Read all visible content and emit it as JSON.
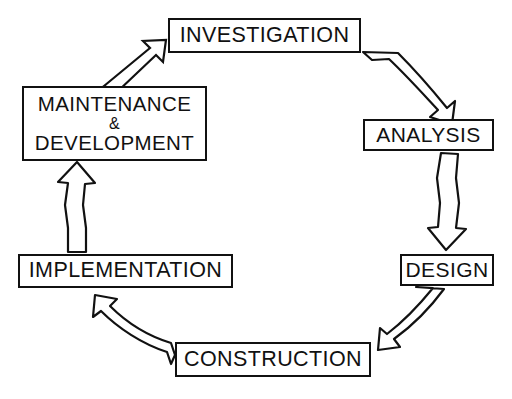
{
  "diagram": {
    "type": "cycle-diagram",
    "style": "hand-drawn black outline on white",
    "colors": {
      "stroke": "#111111",
      "background": "#ffffff",
      "text": "#111111"
    },
    "nodes": [
      {
        "id": "investigation",
        "label": "INVESTIGATION",
        "lines": [
          "INVESTIGATION"
        ],
        "position": "top-center"
      },
      {
        "id": "analysis",
        "label": "ANALYSIS",
        "lines": [
          "ANALYSIS"
        ],
        "position": "right-upper"
      },
      {
        "id": "design",
        "label": "DESIGN",
        "lines": [
          "DESIGN"
        ],
        "position": "right-lower"
      },
      {
        "id": "construction",
        "label": "CONSTRUCTION",
        "lines": [
          "CONSTRUCTION"
        ],
        "position": "bottom-center"
      },
      {
        "id": "implementation",
        "label": "IMPLEMENTATION",
        "lines": [
          "IMPLEMENTATION"
        ],
        "position": "left-lower"
      },
      {
        "id": "maintenance",
        "label": "MAINTENANCE & DEVELOPMENT",
        "lines": [
          "MAINTENANCE",
          "&",
          "DEVELOPMENT"
        ],
        "position": "left-upper"
      }
    ],
    "arrows": [
      {
        "id": "arrow-investigation-analysis",
        "from": "investigation",
        "to": "analysis",
        "shape": "curved-down-right"
      },
      {
        "id": "arrow-analysis-design",
        "from": "analysis",
        "to": "design",
        "shape": "straight-down"
      },
      {
        "id": "arrow-design-construction",
        "from": "design",
        "to": "construction",
        "shape": "curved-down-left"
      },
      {
        "id": "arrow-construction-implementation",
        "from": "construction",
        "to": "implementation",
        "shape": "curved-up-left"
      },
      {
        "id": "arrow-implementation-maintenance",
        "from": "implementation",
        "to": "maintenance",
        "shape": "straight-up"
      },
      {
        "id": "arrow-maintenance-investigation",
        "from": "maintenance",
        "to": "investigation",
        "shape": "diagonal-up-right"
      }
    ]
  },
  "nodes": {
    "investigation": {
      "label": "INVESTIGATION"
    },
    "analysis": {
      "label": "ANALYSIS"
    },
    "design": {
      "label": "DESIGN"
    },
    "construction": {
      "label": "CONSTRUCTION"
    },
    "implementation": {
      "label": "IMPLEMENTATION"
    },
    "maintenance": {
      "line1": "MAINTENANCE",
      "line2": "&",
      "line3": "DEVELOPMENT"
    }
  }
}
